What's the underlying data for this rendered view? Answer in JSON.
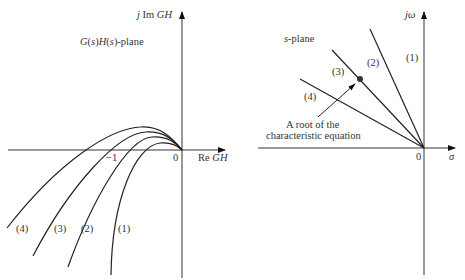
{
  "left_plot": {
    "title": "G(s)H(s)-plane",
    "title_parts": [
      "G",
      "(",
      "s",
      ")",
      "H",
      "(",
      "s",
      ")",
      "-plane"
    ],
    "y_axis_label_prefix": "j Im ",
    "y_axis_label_var": "GH",
    "x_axis_label_prefix": "Re ",
    "x_axis_label_var": "GH",
    "tick_minus_one": "−1",
    "tick_zero": "0",
    "curves": [
      {
        "id": "1",
        "label": "(1)"
      },
      {
        "id": "2",
        "label": "(2)"
      },
      {
        "id": "3",
        "label": "(3)"
      },
      {
        "id": "4",
        "label": "(4)"
      }
    ]
  },
  "right_plot": {
    "title_var": "s",
    "title_suffix": "-plane",
    "y_axis_label": "jω",
    "x_axis_label": "σ",
    "tick_zero": "0",
    "lines": [
      {
        "id": "1",
        "label": "(1)"
      },
      {
        "id": "2",
        "label": "(2)"
      },
      {
        "id": "3",
        "label": "(3)"
      },
      {
        "id": "4",
        "label": "(4)"
      }
    ],
    "annotation_line1": "A root of the",
    "annotation_line2": "characteristic equation"
  },
  "colors": {
    "ink": "#222222",
    "background": "#ffffff"
  }
}
